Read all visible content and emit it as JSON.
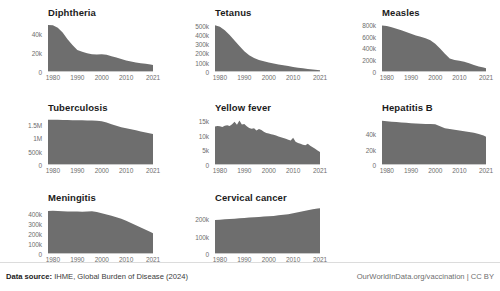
{
  "footer": {
    "source_label": "Data source:",
    "source_text": "IHME, Global Burden of Disease (2024)",
    "credit": "OurWorldInData.org/vaccination | CC BY"
  },
  "style": {
    "area_fill": "#6e6e6e",
    "axis_color": "#c9c9c9",
    "tick_text": "#6e6e6e",
    "title_text": "#1b1b1b",
    "background": "#ffffff"
  },
  "chart_data": [
    {
      "type": "area",
      "title": "Diphtheria",
      "xlabel": "",
      "ylabel": "",
      "xlim": [
        1978,
        2021
      ],
      "ylim": [
        0,
        52000
      ],
      "grid": false,
      "legend": "none",
      "xticks": [
        "1980",
        "1990",
        "2000",
        "2010",
        "2021"
      ],
      "xtick_values": [
        1980,
        1990,
        2000,
        2010,
        2021
      ],
      "yticks": [
        "0",
        "20k",
        "40k"
      ],
      "ytick_values": [
        0,
        20000,
        40000
      ],
      "x": [
        1978,
        1980,
        1982,
        1984,
        1986,
        1988,
        1990,
        1992,
        1994,
        1996,
        1998,
        2000,
        2002,
        2004,
        2006,
        2008,
        2010,
        2012,
        2014,
        2016,
        2018,
        2020,
        2021
      ],
      "values": [
        49000,
        48500,
        46000,
        41000,
        34000,
        28000,
        23000,
        21000,
        19500,
        18500,
        18200,
        18500,
        18000,
        16500,
        15000,
        13500,
        12000,
        11000,
        10000,
        9200,
        8500,
        7800,
        7400
      ]
    },
    {
      "type": "area",
      "title": "Tetanus",
      "xlabel": "",
      "ylabel": "",
      "xlim": [
        1978,
        2021
      ],
      "ylim": [
        0,
        540000
      ],
      "grid": false,
      "legend": "none",
      "xticks": [
        "1980",
        "1990",
        "2000",
        "2010",
        "2021"
      ],
      "xtick_values": [
        1980,
        1990,
        2000,
        2010,
        2021
      ],
      "yticks": [
        "0",
        "100k",
        "200k",
        "300k",
        "400k",
        "500k"
      ],
      "ytick_values": [
        0,
        100000,
        200000,
        300000,
        400000,
        500000
      ],
      "x": [
        1978,
        1980,
        1982,
        1984,
        1986,
        1988,
        1990,
        1992,
        1994,
        1996,
        1998,
        2000,
        2002,
        2004,
        2006,
        2008,
        2010,
        2012,
        2014,
        2016,
        2018,
        2020,
        2021
      ],
      "values": [
        505000,
        490000,
        450000,
        400000,
        340000,
        280000,
        225000,
        180000,
        150000,
        130000,
        115000,
        103000,
        92000,
        82000,
        73000,
        64000,
        55000,
        47000,
        40000,
        33000,
        27000,
        22000,
        19000
      ]
    },
    {
      "type": "area",
      "title": "Measles",
      "xlabel": "",
      "ylabel": "",
      "xlim": [
        1978,
        2021
      ],
      "ylim": [
        0,
        850000
      ],
      "grid": false,
      "legend": "none",
      "xticks": [
        "1980",
        "1990",
        "2000",
        "2010",
        "2021"
      ],
      "xtick_values": [
        1980,
        1990,
        2000,
        2010,
        2021
      ],
      "yticks": [
        "0",
        "200k",
        "400k",
        "600k",
        "800k"
      ],
      "ytick_values": [
        0,
        200000,
        400000,
        600000,
        800000
      ],
      "x": [
        1978,
        1980,
        1982,
        1984,
        1986,
        1988,
        1990,
        1992,
        1994,
        1996,
        1998,
        2000,
        2002,
        2004,
        2006,
        2008,
        2010,
        2012,
        2014,
        2016,
        2018,
        2020,
        2021
      ],
      "values": [
        790000,
        780000,
        760000,
        735000,
        710000,
        680000,
        650000,
        620000,
        600000,
        575000,
        540000,
        480000,
        400000,
        310000,
        230000,
        205000,
        190000,
        175000,
        150000,
        120000,
        95000,
        75000,
        62000
      ]
    },
    {
      "type": "area",
      "title": "Tuberculosis",
      "xlabel": "",
      "ylabel": "",
      "xlim": [
        1978,
        2021
      ],
      "ylim": [
        0,
        1800000
      ],
      "grid": false,
      "legend": "none",
      "xticks": [
        "1980",
        "1990",
        "2000",
        "2010",
        "2021"
      ],
      "xtick_values": [
        1980,
        1990,
        2000,
        2010,
        2021
      ],
      "yticks": [
        "0",
        "500k",
        "1M",
        "1.5M"
      ],
      "ytick_values": [
        0,
        500000,
        1000000,
        1500000
      ],
      "x": [
        1978,
        1980,
        1982,
        1984,
        1986,
        1988,
        1990,
        1992,
        1994,
        1996,
        1998,
        2000,
        2002,
        2004,
        2006,
        2008,
        2010,
        2012,
        2014,
        2016,
        2018,
        2020,
        2021
      ],
      "values": [
        1700000,
        1700000,
        1695000,
        1690000,
        1685000,
        1680000,
        1680000,
        1675000,
        1670000,
        1665000,
        1660000,
        1640000,
        1590000,
        1530000,
        1470000,
        1420000,
        1380000,
        1340000,
        1300000,
        1260000,
        1220000,
        1180000,
        1160000
      ]
    },
    {
      "type": "area",
      "title": "Yellow fever",
      "xlabel": "",
      "ylabel": "",
      "xlim": [
        1978,
        2021
      ],
      "ylim": [
        0,
        16500
      ],
      "grid": false,
      "legend": "none",
      "xticks": [
        "1980",
        "1990",
        "2000",
        "2010",
        "2021"
      ],
      "xtick_values": [
        1980,
        1990,
        2000,
        2010,
        2021
      ],
      "yticks": [
        "0",
        "5k",
        "10k",
        "15k"
      ],
      "ytick_values": [
        0,
        5000,
        10000,
        15000
      ],
      "x": [
        1978,
        1979,
        1980,
        1981,
        1982,
        1983,
        1984,
        1985,
        1986,
        1987,
        1988,
        1989,
        1990,
        1991,
        1992,
        1993,
        1994,
        1995,
        1996,
        1997,
        1998,
        1999,
        2000,
        2001,
        2002,
        2003,
        2004,
        2005,
        2006,
        2007,
        2008,
        2009,
        2010,
        2011,
        2012,
        2013,
        2014,
        2015,
        2016,
        2017,
        2018,
        2019,
        2020,
        2021
      ],
      "values": [
        13200,
        13400,
        13300,
        13100,
        13500,
        13700,
        13400,
        14000,
        14900,
        13800,
        15300,
        13900,
        14100,
        13300,
        12700,
        12500,
        12600,
        11900,
        12400,
        12000,
        11400,
        11000,
        10800,
        10600,
        10400,
        10100,
        9800,
        9500,
        9300,
        9000,
        8700,
        8400,
        9400,
        8000,
        7600,
        7300,
        7000,
        6800,
        7300,
        6600,
        6100,
        5600,
        5000,
        4500
      ]
    },
    {
      "type": "area",
      "title": "Hepatitis B",
      "xlabel": "",
      "ylabel": "",
      "xlim": [
        1978,
        2021
      ],
      "ylim": [
        0,
        62000
      ],
      "grid": false,
      "legend": "none",
      "xticks": [
        "1980",
        "1990",
        "2000",
        "2010",
        "2021"
      ],
      "xtick_values": [
        1980,
        1990,
        2000,
        2010,
        2021
      ],
      "yticks": [
        "0",
        "20k",
        "40k"
      ],
      "ytick_values": [
        0,
        20000,
        40000
      ],
      "x": [
        1978,
        1980,
        1982,
        1984,
        1986,
        1988,
        1990,
        1992,
        1994,
        1996,
        1998,
        2000,
        2002,
        2004,
        2006,
        2008,
        2010,
        2012,
        2014,
        2016,
        2018,
        2020,
        2021
      ],
      "values": [
        57000,
        56500,
        56000,
        55500,
        55000,
        54500,
        54000,
        53500,
        53200,
        53000,
        52800,
        52500,
        50000,
        47500,
        46500,
        45500,
        44500,
        43500,
        42500,
        41500,
        40000,
        38000,
        36500
      ]
    },
    {
      "type": "area",
      "title": "Meningitis",
      "xlabel": "",
      "ylabel": "",
      "xlim": [
        1978,
        2021
      ],
      "ylim": [
        0,
        470000
      ],
      "grid": false,
      "legend": "none",
      "xticks": [
        "1980",
        "1990",
        "2000",
        "2010",
        "2021"
      ],
      "xtick_values": [
        1980,
        1990,
        2000,
        2010,
        2021
      ],
      "yticks": [
        "0",
        "100k",
        "200k",
        "300k",
        "400k"
      ],
      "ytick_values": [
        0,
        100000,
        200000,
        300000,
        400000
      ],
      "x": [
        1978,
        1980,
        1982,
        1984,
        1986,
        1988,
        1990,
        1992,
        1994,
        1996,
        1998,
        2000,
        2002,
        2004,
        2006,
        2008,
        2010,
        2012,
        2014,
        2016,
        2018,
        2020,
        2021
      ],
      "values": [
        430000,
        432000,
        430000,
        428000,
        426000,
        425000,
        424000,
        423000,
        425000,
        428000,
        420000,
        408000,
        395000,
        382000,
        368000,
        352000,
        332000,
        310000,
        288000,
        265000,
        242000,
        220000,
        208000
      ]
    },
    {
      "type": "area",
      "title": "Cervical cancer",
      "xlabel": "",
      "ylabel": "",
      "xlim": [
        1978,
        2021
      ],
      "ylim": [
        0,
        270000
      ],
      "grid": false,
      "legend": "none",
      "xticks": [
        "1980",
        "1990",
        "2000",
        "2010",
        "2021"
      ],
      "xtick_values": [
        1980,
        1990,
        2000,
        2010,
        2021
      ],
      "yticks": [
        "0",
        "100k",
        "200k"
      ],
      "ytick_values": [
        0,
        100000,
        200000
      ],
      "x": [
        1978,
        1980,
        1982,
        1984,
        1986,
        1988,
        1990,
        1992,
        1994,
        1996,
        1998,
        2000,
        2002,
        2004,
        2006,
        2008,
        2010,
        2012,
        2014,
        2016,
        2018,
        2020,
        2021
      ],
      "values": [
        196000,
        197000,
        199000,
        201000,
        203000,
        205000,
        207000,
        209000,
        211000,
        213000,
        215000,
        217000,
        219000,
        222000,
        225000,
        229000,
        234000,
        240000,
        246000,
        252000,
        257000,
        261000,
        263000
      ]
    }
  ]
}
